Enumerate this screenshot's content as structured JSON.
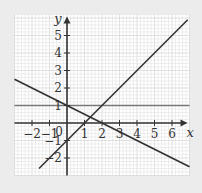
{
  "chart_data": {
    "type": "line",
    "title": "",
    "xlabel": "x",
    "ylabel": "y",
    "xlim": [
      -3,
      7
    ],
    "ylim": [
      -3,
      6.2
    ],
    "grid": true,
    "x_ticks": [
      -2,
      -1,
      0,
      1,
      2,
      3,
      4,
      5,
      6
    ],
    "x_tick_labels": [
      "−2",
      "−1",
      "0",
      "1",
      "2",
      "3",
      "4",
      "5",
      "6"
    ],
    "y_ticks": [
      5,
      4,
      3,
      2,
      1,
      -1,
      -2
    ],
    "y_tick_labels": [
      "5",
      "4",
      "3",
      "2",
      "1",
      "−1",
      "−2"
    ],
    "origin_label": "0",
    "series": [
      {
        "name": "y = 1",
        "equation": "y = 1",
        "x": [
          -3,
          7
        ],
        "y": [
          1,
          1
        ],
        "color": "#777777"
      },
      {
        "name": "y = 1 - x/2",
        "equation": "y = 1 - 0.5x",
        "x": [
          -3,
          7
        ],
        "y": [
          2.5,
          -2.5
        ],
        "color": "#333333"
      },
      {
        "name": "y = x - 1",
        "equation": "y = x - 1",
        "x": [
          -1.6,
          6.9
        ],
        "y": [
          -2.6,
          5.9
        ],
        "color": "#333333"
      }
    ],
    "colors": {
      "background": "#ececec",
      "grid_bg": "#ffffff",
      "minor_grid": "#e2e2e2",
      "major_grid": "#cfcfcf",
      "axis": "#333333"
    }
  }
}
